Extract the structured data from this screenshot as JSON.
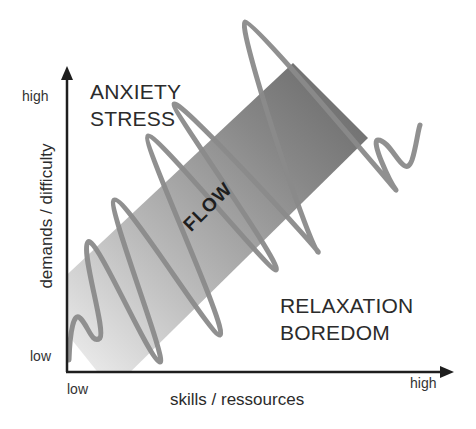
{
  "diagram": {
    "type": "flow-model",
    "zones": {
      "top_left": [
        "ANXIETY",
        "STRESS"
      ],
      "center": "FLOW",
      "bottom_right": [
        "RELAXATION",
        "BOREDOM"
      ]
    },
    "y_axis": {
      "title": "demands / difficulty",
      "high_label": "high",
      "low_label": "low"
    },
    "x_axis": {
      "title": "skills / ressources",
      "low_label": "low",
      "high_label": "high"
    },
    "colors": {
      "axis": "#1e1e1e",
      "band_light": "#e4e4e4",
      "band_mid": "#a8a8a8",
      "band_dark": "#6a6a6a",
      "wave": "#8a8a8a",
      "text": "#2b2b2b"
    }
  }
}
